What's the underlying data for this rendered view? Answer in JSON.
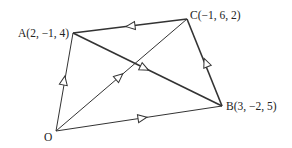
{
  "diagram": {
    "type": "vector-geometry",
    "points": {
      "O": {
        "label": "O",
        "x": 56,
        "y": 131
      },
      "A": {
        "label": "A(2, −1, 4)",
        "x": 73,
        "y": 33
      },
      "B": {
        "label": "B(3, −2, 5)",
        "x": 222,
        "y": 106
      },
      "C": {
        "label": "C(−1, 6, 2)",
        "x": 187,
        "y": 19
      }
    },
    "edges": [
      {
        "from": "O",
        "to": "A",
        "arrow": "toward A",
        "weight": "thin"
      },
      {
        "from": "O",
        "to": "C",
        "arrow": "toward C",
        "weight": "thin"
      },
      {
        "from": "O",
        "to": "B",
        "arrow": "toward B",
        "weight": "thin"
      },
      {
        "from": "C",
        "to": "A",
        "arrow": "toward A",
        "weight": "thick"
      },
      {
        "from": "A",
        "to": "B",
        "arrow": "toward B",
        "weight": "thick"
      },
      {
        "from": "B",
        "to": "C",
        "arrow": "toward C",
        "weight": "thick"
      }
    ],
    "colors": {
      "line": "#333333",
      "background": "#ffffff"
    }
  }
}
